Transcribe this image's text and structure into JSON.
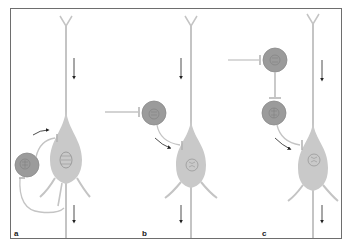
{
  "figure": {
    "panels": [
      {
        "id": "a",
        "label": "a",
        "description": "Recurrent (feedback) inhibition: pyramidal cell axon collateral excites interneuron which inhibits the pyramidal cell"
      },
      {
        "id": "b",
        "label": "b",
        "description": "Feedforward inhibition: external input drives interneuron inhibiting the pyramidal cell"
      },
      {
        "id": "c",
        "label": "c",
        "description": "Disinhibition: one interneuron inhibits a second interneuron that inhibits the pyramidal cell"
      }
    ],
    "colors": {
      "pyramidal_cell": "#c9c9c9",
      "pyramidal_process": "#c4c4c4",
      "interneuron": "#9b9b9b",
      "interneuron_edge": "#8a8a8a",
      "nucleus_outline": "#7d7d7d",
      "arrow": "#222222",
      "frame": "#6e6e6e",
      "background": "#ffffff"
    }
  }
}
